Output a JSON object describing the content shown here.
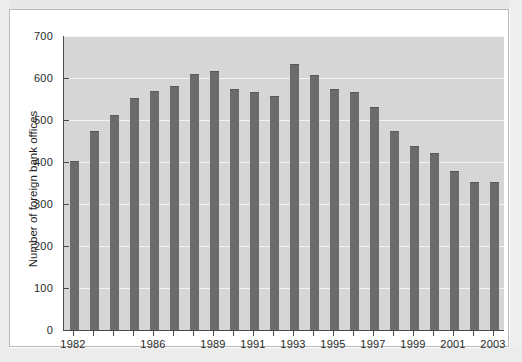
{
  "chart_data": {
    "type": "bar",
    "title": "",
    "xlabel": "",
    "ylabel": "Number of foreign bank offices",
    "ylim": [
      0,
      700
    ],
    "ytick_values": [
      0,
      100,
      200,
      300,
      400,
      500,
      600,
      700
    ],
    "ytick_labels": [
      "0",
      "100",
      "200",
      "300",
      "400",
      "500",
      "600",
      "700"
    ],
    "grid": true,
    "legend": "none",
    "bar_color": "#6b6b6b",
    "plot_background": "#d6d6d6",
    "categories": [
      "1982",
      "1983",
      "1984",
      "1985",
      "1986",
      "1987",
      "1988",
      "1989",
      "1990",
      "1991",
      "1992",
      "1993",
      "1994",
      "1995",
      "1996",
      "1997",
      "1998",
      "1999",
      "2000",
      "2001",
      "2002",
      "2003"
    ],
    "values": [
      402,
      474,
      512,
      552,
      568,
      582,
      610,
      616,
      574,
      566,
      556,
      634,
      606,
      574,
      566,
      532,
      474,
      438,
      422,
      378,
      352,
      352
    ],
    "xtick_labels_shown": [
      "1982",
      "1986",
      "1989",
      "1991",
      "1993",
      "1995",
      "1997",
      "1999",
      "2001",
      "2003"
    ]
  }
}
